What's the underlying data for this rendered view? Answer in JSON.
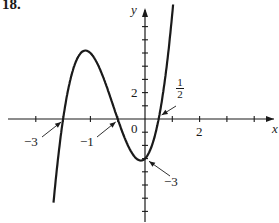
{
  "problem_number": "18.",
  "chart_data": {
    "type": "line",
    "title": "",
    "function": "y = (x + 3)(x + 1)(2x - 1)",
    "xlabel": "x",
    "ylabel": "y",
    "xlim": [
      -5,
      4.6
    ],
    "ylim": [
      -8,
      8.5
    ],
    "grid": false,
    "x_tick_step": 1,
    "y_tick_step": 1,
    "x_tick_labels": [
      {
        "value": 2,
        "label": "2"
      }
    ],
    "y_tick_labels": [
      {
        "value": 2,
        "label": "2"
      }
    ],
    "origin_label": "0",
    "annotations": [
      {
        "label": "−3",
        "point": [
          -3,
          0
        ],
        "meaning": "x-intercept"
      },
      {
        "label": "−1",
        "point": [
          -1,
          0
        ],
        "meaning": "x-intercept"
      },
      {
        "label": "1/2",
        "point": [
          0.5,
          0
        ],
        "meaning": "x-intercept"
      },
      {
        "label": "−3",
        "point": [
          0,
          -3
        ],
        "meaning": "y-intercept"
      }
    ],
    "series": [
      {
        "name": "f(x)",
        "x_intercepts": [
          -3,
          -1,
          0.5
        ],
        "y_intercept": -3,
        "local_max": [
          -2.1,
          3.1
        ],
        "local_min": [
          -0.15,
          -3.1
        ]
      }
    ]
  },
  "labels": {
    "x_axis": "x",
    "y_axis": "y",
    "origin": "0",
    "xtick_2": "2",
    "ytick_2": "2",
    "ann_neg3_x": "−3",
    "ann_neg1_x": "−1",
    "ann_half_num": "1",
    "ann_half_den": "2",
    "ann_neg3_y": "−3"
  }
}
